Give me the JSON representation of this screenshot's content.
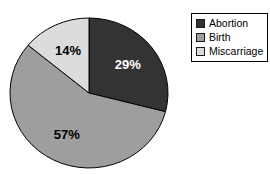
{
  "background_color": "#ffffff",
  "chart_data": {
    "type": "pie",
    "categories": [
      "Abortion",
      "Birth",
      "Miscarriage"
    ],
    "values": [
      29,
      57,
      14
    ],
    "value_labels": [
      "29%",
      "57%",
      "14%"
    ],
    "colors": [
      "#333333",
      "#9e9e9e",
      "#dcdcdc"
    ],
    "label_colors": [
      "#ffffff",
      "#000000",
      "#000000"
    ],
    "outline_color": "#000000",
    "start_angle_deg": 0,
    "direction": "clockwise",
    "legend_position": "top-right",
    "title": ""
  },
  "legend": {
    "items": [
      {
        "label": "Abortion",
        "color": "#333333"
      },
      {
        "label": "Birth",
        "color": "#9e9e9e"
      },
      {
        "label": "Miscarriage",
        "color": "#dcdcdc"
      }
    ]
  }
}
